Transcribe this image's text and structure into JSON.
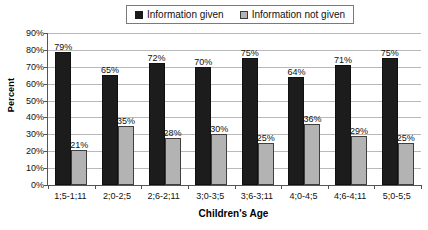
{
  "chart_data": {
    "type": "bar",
    "title": "",
    "xlabel": "Children's Age",
    "ylabel": "Percent",
    "ylim": [
      0,
      90
    ],
    "ytick_labels": [
      "0%",
      "10%",
      "20%",
      "30%",
      "40%",
      "50%",
      "60%",
      "70%",
      "80%",
      "90%"
    ],
    "ytick_values": [
      0,
      10,
      20,
      30,
      40,
      50,
      60,
      70,
      80,
      90
    ],
    "grid": true,
    "legend_position": "top-center",
    "categories": [
      "1;5-1;11",
      "2;0-2;5",
      "2;6-2;11",
      "3;0-3;5",
      "3;6-3;11",
      "4;0-4;5",
      "4;6-4;11",
      "5;0-5;5"
    ],
    "series": [
      {
        "name": "Information given",
        "color": "#1c1c1c",
        "values": [
          79,
          65,
          72,
          70,
          75,
          64,
          71,
          75
        ],
        "labels": [
          "79%",
          "65%",
          "72%",
          "70%",
          "75%",
          "64%",
          "71%",
          "75%"
        ]
      },
      {
        "name": "Information not given",
        "color": "#b3b3b3",
        "values": [
          21,
          35,
          28,
          30,
          25,
          36,
          29,
          25
        ],
        "labels": [
          "21%",
          "35%",
          "28%",
          "30%",
          "25%",
          "36%",
          "29%",
          "25%"
        ]
      }
    ]
  },
  "legend": {
    "entries": [
      {
        "label": "Information given",
        "swatch": "given"
      },
      {
        "label": "Information not given",
        "swatch": "notgiven"
      }
    ]
  }
}
